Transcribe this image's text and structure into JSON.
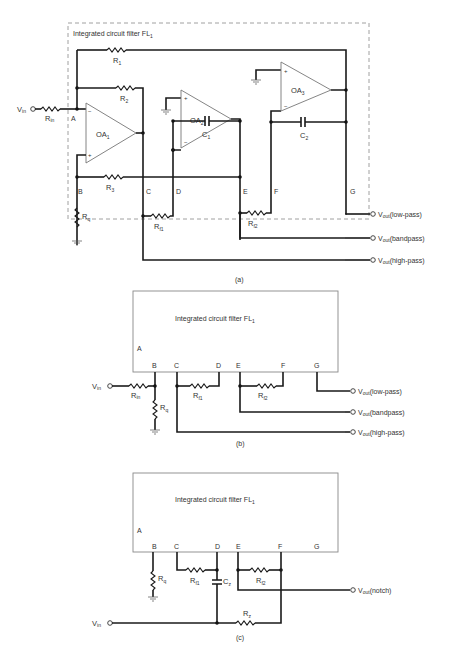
{
  "panel_a": {
    "caption": "(a)",
    "box_title": "Integrated circuit filter FL",
    "box_title_sub": "1",
    "input": {
      "label": "V",
      "sub": "in"
    },
    "resistors": {
      "rin": {
        "label": "R",
        "sub": "in"
      },
      "r1": {
        "label": "R",
        "sub": "1"
      },
      "r2": {
        "label": "R",
        "sub": "2"
      },
      "r3": {
        "label": "R",
        "sub": "3"
      },
      "rq": {
        "label": "R",
        "sub": "q"
      },
      "rf1": {
        "label": "R",
        "sub": "f1"
      },
      "rf2": {
        "label": "R",
        "sub": "f2"
      }
    },
    "capacitors": {
      "c1": {
        "label": "C",
        "sub": "1"
      },
      "c2": {
        "label": "C",
        "sub": "2"
      }
    },
    "opamps": [
      {
        "label": "OA",
        "sub": "1"
      },
      {
        "label": "OA",
        "sub": "2"
      },
      {
        "label": "OA",
        "sub": "3"
      }
    ],
    "pins": [
      "A",
      "B",
      "C",
      "D",
      "E",
      "F",
      "G"
    ],
    "outputs": [
      {
        "label": "V",
        "sub": "out",
        "mode": "(low-pass)"
      },
      {
        "label": "V",
        "sub": "out",
        "mode": "(bandpass)"
      },
      {
        "label": "V",
        "sub": "out",
        "mode": "(high-pass)"
      }
    ]
  },
  "panel_b": {
    "caption": "(b)",
    "box_title": "Integrated circuit filter FL",
    "box_title_sub": "1",
    "input": {
      "label": "V",
      "sub": "in"
    },
    "resistors": {
      "rin": {
        "label": "R",
        "sub": "in"
      },
      "rq": {
        "label": "R",
        "sub": "q"
      },
      "rf1": {
        "label": "R",
        "sub": "f1"
      },
      "rf2": {
        "label": "R",
        "sub": "f2"
      }
    },
    "pins": [
      "A",
      "B",
      "C",
      "D",
      "E",
      "F",
      "G"
    ],
    "outputs": [
      {
        "label": "V",
        "sub": "out",
        "mode": "(low-pass)"
      },
      {
        "label": "V",
        "sub": "out",
        "mode": "(bandpass)"
      },
      {
        "label": "V",
        "sub": "out",
        "mode": "(high-pass)"
      }
    ]
  },
  "panel_c": {
    "caption": "(c)",
    "box_title": "Integrated circuit filter FL",
    "box_title_sub": "1",
    "input": {
      "label": "V",
      "sub": "in"
    },
    "resistors": {
      "rq": {
        "label": "R",
        "sub": "q"
      },
      "rf1": {
        "label": "R",
        "sub": "f1"
      },
      "rf2": {
        "label": "R",
        "sub": "f2"
      },
      "rz": {
        "label": "R",
        "sub": "z"
      }
    },
    "capacitors": {
      "cz": {
        "label": "C",
        "sub": "z"
      }
    },
    "pins": [
      "A",
      "B",
      "C",
      "D",
      "E",
      "F",
      "G"
    ],
    "outputs": [
      {
        "label": "V",
        "sub": "out",
        "mode": "(notch)"
      }
    ]
  }
}
